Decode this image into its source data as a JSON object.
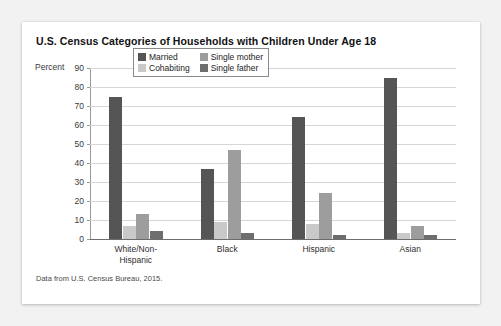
{
  "card": {
    "title": "U.S. Census Categories of Households with Children Under Age 18",
    "source_note": "Data from U.S. Census Bureau, 2015."
  },
  "axis": {
    "y_title": "Percent",
    "ticks": [
      "90",
      "80",
      "70",
      "60",
      "50",
      "40",
      "30",
      "20",
      "10",
      "0"
    ]
  },
  "legend": {
    "items": [
      {
        "label": "Married",
        "color": "#555555"
      },
      {
        "label": "Single mother",
        "color": "#9d9d9d"
      },
      {
        "label": "Cohabiting",
        "color": "#c9c9c9"
      },
      {
        "label": "Single father",
        "color": "#6e6e6e"
      }
    ]
  },
  "chart_data": {
    "type": "bar",
    "title": "U.S. Census Categories of Households with Children Under Age 18",
    "xlabel": "",
    "ylabel": "Percent",
    "ylim": [
      0,
      90
    ],
    "ytick_step": 10,
    "grid": true,
    "legend_position": "inside-top-center",
    "categories": [
      "White/Non-Hispanic",
      "Black",
      "Hispanic",
      "Asian"
    ],
    "category_label_lines": [
      [
        "White/Non-",
        "Hispanic"
      ],
      [
        "Black"
      ],
      [
        "Hispanic"
      ],
      [
        "Asian"
      ]
    ],
    "series": [
      {
        "name": "Married",
        "color": "#555555",
        "values": [
          75,
          37,
          64,
          85
        ]
      },
      {
        "name": "Cohabiting",
        "color": "#c9c9c9",
        "values": [
          7,
          9,
          8,
          3
        ]
      },
      {
        "name": "Single mother",
        "color": "#9d9d9d",
        "values": [
          13,
          47,
          24,
          7
        ]
      },
      {
        "name": "Single father",
        "color": "#6e6e6e",
        "values": [
          4,
          3,
          2,
          2
        ]
      }
    ],
    "annotation": "Data from U.S. Census Bureau, 2015."
  }
}
